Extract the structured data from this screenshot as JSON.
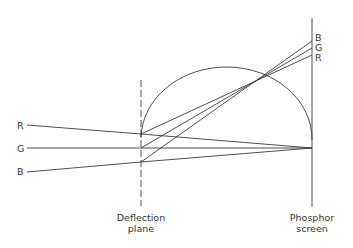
{
  "diagram": {
    "labels": {
      "left_r": "R",
      "left_g": "G",
      "left_b": "B",
      "right_b": "B",
      "right_g": "G",
      "right_r": "R",
      "deflection_line1": "Deflection",
      "deflection_line2": "plane",
      "screen_line1": "Phosphor",
      "screen_line2": "screen"
    },
    "colors": {
      "stroke": "#3a3a3a",
      "text": "#333333",
      "background": "#ffffff"
    },
    "geometry": {
      "deflection_plane_x": 141,
      "screen_x": 312,
      "convergence_point": [
        312,
        148
      ],
      "crossover_point": [
        262,
        77
      ],
      "arc_center": [
        226,
        141
      ],
      "beams": [
        {
          "name": "R",
          "start": [
            27,
            125
          ],
          "deflect": [
            141,
            134
          ],
          "end_undeflected": [
            312,
            148
          ],
          "end_deflected": [
            312,
            55
          ]
        },
        {
          "name": "G",
          "start": [
            27,
            148
          ],
          "deflect": [
            141,
            148
          ],
          "end_undeflected": [
            312,
            148
          ],
          "end_deflected": [
            312,
            48
          ]
        },
        {
          "name": "B",
          "start": [
            27,
            172
          ],
          "deflect": [
            141,
            162
          ],
          "end_undeflected": [
            312,
            148
          ],
          "end_deflected": [
            312,
            41
          ]
        }
      ]
    }
  }
}
